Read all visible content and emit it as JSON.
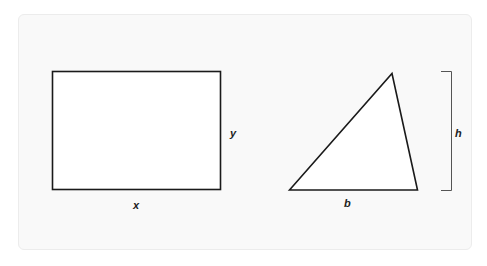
{
  "diagram": {
    "rectangle": {
      "width_label": "x",
      "height_label": "y"
    },
    "triangle": {
      "base_label": "b",
      "height_label": "h"
    },
    "colors": {
      "stroke": "#1a1a1a",
      "bracket": "#555555",
      "panel": "#f9f9f9",
      "panel_border": "#ececec"
    }
  }
}
